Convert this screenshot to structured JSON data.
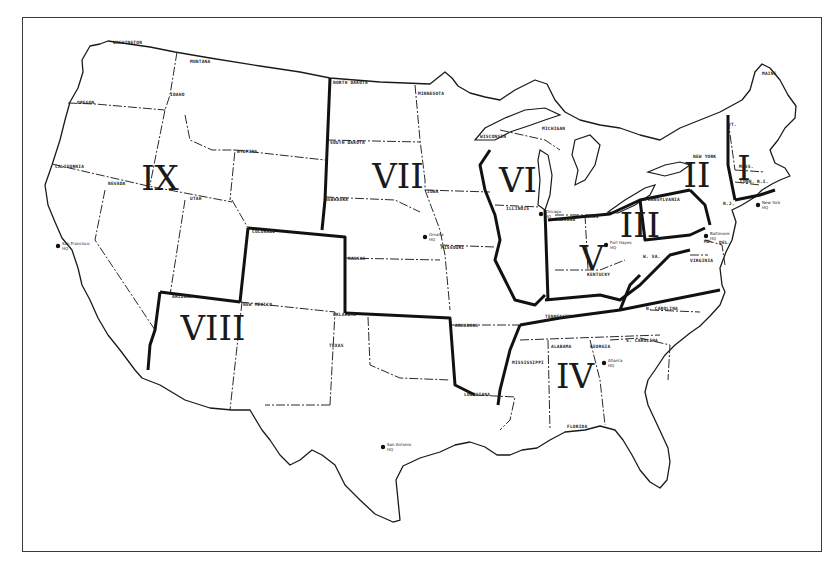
{
  "map": {
    "frame": {
      "x": 22,
      "y": 17,
      "width": 800,
      "height": 535,
      "border_color": "#3a3a3a"
    },
    "colors": {
      "background": "#ffffff",
      "line": "#1a1a1a"
    },
    "regions": [
      {
        "id": "I",
        "label": "I",
        "x": 744,
        "y": 180
      },
      {
        "id": "II",
        "label": "II",
        "x": 697,
        "y": 187
      },
      {
        "id": "III",
        "label": "III",
        "x": 640,
        "y": 237
      },
      {
        "id": "IV",
        "label": "IV",
        "x": 575,
        "y": 388
      },
      {
        "id": "V",
        "label": "V",
        "x": 592,
        "y": 270
      },
      {
        "id": "VI",
        "label": "VI",
        "x": 518,
        "y": 192
      },
      {
        "id": "VII",
        "label": "VII",
        "x": 398,
        "y": 188
      },
      {
        "id": "VIII",
        "label": "VIII",
        "x": 213,
        "y": 340
      },
      {
        "id": "IX",
        "label": "IX",
        "x": 160,
        "y": 190
      }
    ],
    "states": [
      {
        "name": "WASHINGTON",
        "x": 113,
        "y": 44
      },
      {
        "name": "MONTANA",
        "x": 190,
        "y": 63
      },
      {
        "name": "IDAHO",
        "x": 170,
        "y": 96
      },
      {
        "name": "OREGON",
        "x": 77,
        "y": 104
      },
      {
        "name": "WYOMING",
        "x": 237,
        "y": 153
      },
      {
        "name": "CALIFORNIA",
        "x": 55,
        "y": 168
      },
      {
        "name": "NEVADA",
        "x": 108,
        "y": 185
      },
      {
        "name": "UTAH",
        "x": 190,
        "y": 200
      },
      {
        "name": "COLORADO",
        "x": 252,
        "y": 233
      },
      {
        "name": "ARIZONA",
        "x": 172,
        "y": 298
      },
      {
        "name": "NEW MEXICO",
        "x": 243,
        "y": 306
      },
      {
        "name": "NORTH DAKOTA",
        "x": 333,
        "y": 84
      },
      {
        "name": "SOUTH DAKOTA",
        "x": 330,
        "y": 144
      },
      {
        "name": "NEBRASKA",
        "x": 325,
        "y": 201
      },
      {
        "name": "KANSAS",
        "x": 348,
        "y": 260
      },
      {
        "name": "OKLAHOMA",
        "x": 333,
        "y": 316
      },
      {
        "name": "TEXAS",
        "x": 329,
        "y": 347
      },
      {
        "name": "MINNESOTA",
        "x": 418,
        "y": 95
      },
      {
        "name": "IOWA",
        "x": 427,
        "y": 193
      },
      {
        "name": "MISSOURI",
        "x": 441,
        "y": 249
      },
      {
        "name": "ARKANSAS",
        "x": 455,
        "y": 327
      },
      {
        "name": "LOUISIANA",
        "x": 464,
        "y": 396
      },
      {
        "name": "WISCONSIN",
        "x": 480,
        "y": 138
      },
      {
        "name": "MICHIGAN",
        "x": 542,
        "y": 130
      },
      {
        "name": "ILLINOIS",
        "x": 506,
        "y": 210
      },
      {
        "name": "INDIANA",
        "x": 555,
        "y": 221
      },
      {
        "name": "OHIO",
        "x": 587,
        "y": 218
      },
      {
        "name": "KENTUCKY",
        "x": 587,
        "y": 276
      },
      {
        "name": "TENNESSEE",
        "x": 545,
        "y": 318
      },
      {
        "name": "MISSISSIPPI",
        "x": 512,
        "y": 364
      },
      {
        "name": "ALABAMA",
        "x": 551,
        "y": 348
      },
      {
        "name": "GEORGIA",
        "x": 590,
        "y": 348
      },
      {
        "name": "FLORIDA",
        "x": 567,
        "y": 428
      },
      {
        "name": "S. CAROLINA",
        "x": 626,
        "y": 342
      },
      {
        "name": "N. CAROLINA",
        "x": 646,
        "y": 310
      },
      {
        "name": "VIRGINIA",
        "x": 690,
        "y": 262
      },
      {
        "name": "W. VA.",
        "x": 643,
        "y": 258
      },
      {
        "name": "PENNSYLVANIA",
        "x": 645,
        "y": 201
      },
      {
        "name": "NEW YORK",
        "x": 693,
        "y": 158
      },
      {
        "name": "MAINE",
        "x": 762,
        "y": 75
      },
      {
        "name": "VT.",
        "x": 728,
        "y": 126
      },
      {
        "name": "MASS.",
        "x": 739,
        "y": 168
      },
      {
        "name": "CONN.",
        "x": 740,
        "y": 183
      },
      {
        "name": "R.I.",
        "x": 757,
        "y": 183
      },
      {
        "name": "MD.",
        "x": 704,
        "y": 243
      },
      {
        "name": "N.J.",
        "x": 723,
        "y": 205
      },
      {
        "name": "DEL.",
        "x": 719,
        "y": 244
      }
    ],
    "headquarters": [
      {
        "name": "San Francisco",
        "label": "San Francisco",
        "sub": "HQ",
        "x": 58,
        "y": 246
      },
      {
        "name": "San Antonio",
        "label": "San Antonio",
        "sub": "HQ",
        "x": 383,
        "y": 447
      },
      {
        "name": "Omaha",
        "label": "Omaha",
        "sub": "HQ",
        "x": 425,
        "y": 237
      },
      {
        "name": "Chicago",
        "label": "Chicago",
        "sub": "HQ",
        "x": 541,
        "y": 214
      },
      {
        "name": "Fort Hayes",
        "label": "Fort Hayes",
        "sub": "HQ",
        "x": 606,
        "y": 245
      },
      {
        "name": "Atlanta",
        "label": "Atlanta",
        "sub": "HQ",
        "x": 604,
        "y": 363
      },
      {
        "name": "Baltimore",
        "label": "Baltimore",
        "sub": "HQ",
        "x": 706,
        "y": 236
      },
      {
        "name": "New York",
        "label": "New York",
        "sub": "HQ",
        "x": 758,
        "y": 205
      }
    ]
  }
}
